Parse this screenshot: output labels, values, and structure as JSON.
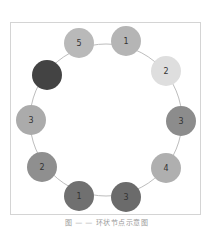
{
  "figure": {
    "caption": "图 — — 环状节点示意图"
  },
  "ring": {
    "center": [
      106,
      120
    ],
    "radius": 76,
    "stroke": "#bdbdbd"
  },
  "nodes": [
    {
      "label": "5",
      "x": 79,
      "y": 43,
      "fill": "#b9b9b9"
    },
    {
      "label": "1",
      "x": 126,
      "y": 41,
      "fill": "#b5b5b5"
    },
    {
      "label": "2",
      "x": 166,
      "y": 71,
      "fill": "#dedede"
    },
    {
      "label": "3",
      "x": 181,
      "y": 121,
      "fill": "#8c8c8c"
    },
    {
      "label": "4",
      "x": 166,
      "y": 168,
      "fill": "#afafaf"
    },
    {
      "label": "3",
      "x": 126,
      "y": 197,
      "fill": "#6b6b6b"
    },
    {
      "label": "1",
      "x": 79,
      "y": 196,
      "fill": "#707070"
    },
    {
      "label": "2",
      "x": 42,
      "y": 167,
      "fill": "#8f8f8f"
    },
    {
      "label": "3",
      "x": 31,
      "y": 120,
      "fill": "#ababab"
    },
    {
      "label": "",
      "x": 47,
      "y": 75,
      "fill": "#434343"
    }
  ],
  "node_radius": 15
}
